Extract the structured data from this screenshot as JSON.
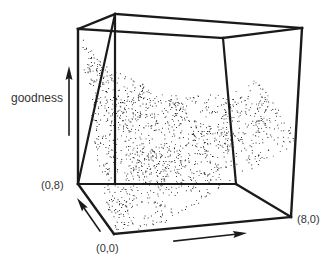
{
  "figure": {
    "type": "3d-surface-stipple",
    "background": "#ffffff",
    "ink_color": "#1a1a1a",
    "labels": {
      "vertical_axis": "goodness",
      "corner_back_left": "(0,8)",
      "corner_origin": "(0,0)",
      "corner_right": "(8,0)"
    },
    "box": {
      "front_top_left": [
        78,
        29
      ],
      "back_top_left": [
        115,
        14
      ],
      "back_top_right": [
        302,
        28
      ],
      "front_top_right": [
        223,
        38
      ],
      "front_bottom_left": [
        114,
        234
      ],
      "back_bottom_left": [
        78,
        184
      ],
      "back_bottom_right": [
        236,
        184
      ],
      "front_bottom_right": [
        291,
        217
      ]
    },
    "arrows": {
      "goodness": {
        "from": [
          69,
          135
        ],
        "to": [
          69,
          66
        ]
      },
      "y_axis": {
        "from": [
          100,
          231
        ],
        "to": [
          77,
          198
        ]
      },
      "x_axis": {
        "from": [
          174,
          241
        ],
        "to": [
          247,
          233
        ]
      }
    },
    "surface": {
      "outline": [
        [
          80,
          34
        ],
        [
          98,
          60
        ],
        [
          118,
          72
        ],
        [
          140,
          82
        ],
        [
          160,
          92
        ],
        [
          180,
          96
        ],
        [
          205,
          95
        ],
        [
          225,
          92
        ],
        [
          240,
          86
        ],
        [
          255,
          80
        ],
        [
          262,
          84
        ],
        [
          275,
          105
        ],
        [
          290,
          125
        ],
        [
          297,
          137
        ],
        [
          285,
          150
        ],
        [
          265,
          160
        ],
        [
          250,
          170
        ],
        [
          225,
          185
        ],
        [
          195,
          205
        ],
        [
          165,
          222
        ],
        [
          140,
          232
        ],
        [
          118,
          233
        ],
        [
          108,
          210
        ],
        [
          100,
          185
        ],
        [
          95,
          150
        ],
        [
          92,
          120
        ],
        [
          88,
          95
        ],
        [
          83,
          65
        ]
      ],
      "dark_regions": [
        {
          "cx": 95,
          "cy": 60,
          "rx": 12,
          "ry": 28
        },
        {
          "cx": 130,
          "cy": 110,
          "rx": 28,
          "ry": 25
        },
        {
          "cx": 175,
          "cy": 110,
          "rx": 20,
          "ry": 12
        },
        {
          "cx": 205,
          "cy": 140,
          "rx": 14,
          "ry": 22
        },
        {
          "cx": 225,
          "cy": 130,
          "rx": 12,
          "ry": 30
        },
        {
          "cx": 262,
          "cy": 110,
          "rx": 8,
          "ry": 25
        },
        {
          "cx": 155,
          "cy": 160,
          "rx": 30,
          "ry": 18
        },
        {
          "cx": 120,
          "cy": 210,
          "rx": 12,
          "ry": 12
        },
        {
          "cx": 158,
          "cy": 185,
          "rx": 10,
          "ry": 10
        },
        {
          "cx": 210,
          "cy": 175,
          "rx": 8,
          "ry": 10
        }
      ],
      "light_regions": [
        {
          "cx": 190,
          "cy": 110,
          "rx": 14,
          "ry": 10
        },
        {
          "cx": 215,
          "cy": 120,
          "rx": 8,
          "ry": 10
        },
        {
          "cx": 255,
          "cy": 95,
          "rx": 6,
          "ry": 10
        },
        {
          "cx": 140,
          "cy": 210,
          "rx": 14,
          "ry": 10
        },
        {
          "cx": 118,
          "cy": 180,
          "rx": 8,
          "ry": 8
        },
        {
          "cx": 120,
          "cy": 80,
          "rx": 8,
          "ry": 6
        },
        {
          "cx": 180,
          "cy": 200,
          "rx": 18,
          "ry": 10
        },
        {
          "cx": 235,
          "cy": 170,
          "rx": 12,
          "ry": 8
        }
      ],
      "dot_count": 9000
    }
  }
}
